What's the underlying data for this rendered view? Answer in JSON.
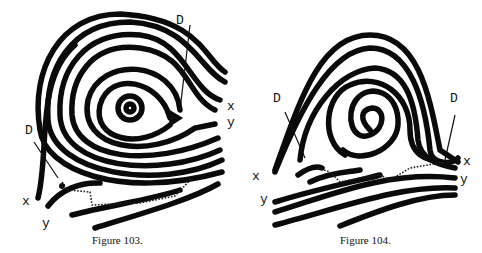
{
  "figures": [
    {
      "caption": "Figure 103.",
      "labels": {
        "delta_top": "D",
        "delta_left": "D",
        "x_right": "x",
        "y_right": "y",
        "x_left": "x",
        "y_left": "y"
      }
    },
    {
      "caption": "Figure 104.",
      "labels": {
        "delta_left": "D",
        "delta_right": "D",
        "x_left": "x",
        "y_left": "y",
        "x_right": "x",
        "y_right": "y"
      }
    }
  ]
}
